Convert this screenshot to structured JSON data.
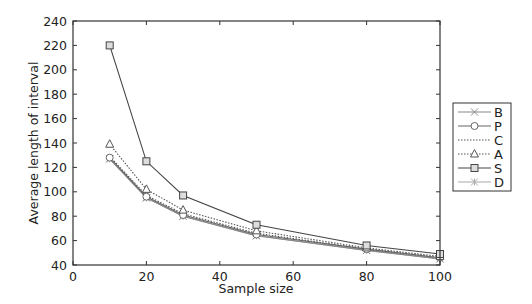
{
  "chart_data": {
    "type": "line",
    "title": "",
    "xlabel": "Sample size",
    "ylabel": "Average length of interval",
    "xlim": [
      0,
      100
    ],
    "ylim": [
      40,
      240
    ],
    "xticks": [
      0,
      20,
      40,
      60,
      80,
      100
    ],
    "yticks": [
      40,
      60,
      80,
      100,
      120,
      140,
      160,
      180,
      200,
      220,
      240
    ],
    "grid": false,
    "legend_position": "right-outside",
    "x": [
      10,
      20,
      30,
      50,
      80,
      100
    ],
    "series": [
      {
        "name": "B",
        "marker": "x",
        "line": "solid",
        "color": "#888888",
        "values": [
          127,
          95,
          80,
          64,
          52,
          45
        ]
      },
      {
        "name": "P",
        "marker": "circle",
        "line": "solid",
        "color": "#666666",
        "values": [
          128,
          96,
          81,
          65,
          53,
          46
        ]
      },
      {
        "name": "C",
        "marker": "none",
        "line": "dotted",
        "color": "#555555",
        "values": [
          129,
          97,
          82,
          66,
          53,
          46
        ]
      },
      {
        "name": "A",
        "marker": "triangle",
        "line": "dotted",
        "color": "#555555",
        "values": [
          139,
          102,
          85,
          68,
          54,
          47
        ]
      },
      {
        "name": "S",
        "marker": "square",
        "line": "solid",
        "color": "#444444",
        "values": [
          220,
          125,
          97,
          73,
          56,
          49
        ]
      },
      {
        "name": "D",
        "marker": "star",
        "line": "solid",
        "color": "#aaaaaa",
        "values": [
          127,
          95,
          80,
          64,
          52,
          45
        ]
      }
    ]
  },
  "axes": {
    "xlabel": "Sample size",
    "ylabel": "Average length of interval"
  },
  "legend": {
    "items": [
      "B",
      "P",
      "C",
      "A",
      "S",
      "D"
    ]
  }
}
